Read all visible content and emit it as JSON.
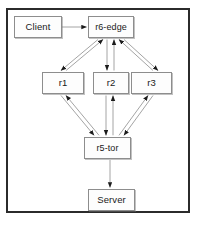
{
  "diagram": {
    "canvas": {
      "width": 200,
      "height": 226
    },
    "background_color": "#ffffff",
    "frame": {
      "name": "diagram-border",
      "x": 6,
      "y": 8,
      "width": 184,
      "height": 205,
      "stroke_color": "#2b2b2b",
      "stroke_width": 2
    },
    "style": {
      "node_fill": "#fdfdfd",
      "node_stroke": "#8d8d8d",
      "edge_color": "#9a9a9a",
      "arrowhead_color": "#1c1c1c",
      "text_color": "#1a1a1a"
    },
    "nodes": [
      {
        "id": "client",
        "label": "Client",
        "x": 14,
        "y": 16,
        "width": 48,
        "height": 22
      },
      {
        "id": "r6edge",
        "label": "r6-edge",
        "x": 88,
        "y": 16,
        "width": 46,
        "height": 22
      },
      {
        "id": "r1",
        "label": "r1",
        "x": 42,
        "y": 72,
        "width": 42,
        "height": 22
      },
      {
        "id": "r2",
        "label": "r2",
        "x": 93,
        "y": 72,
        "width": 36,
        "height": 22
      },
      {
        "id": "r3",
        "label": "r3",
        "x": 131,
        "y": 72,
        "width": 41,
        "height": 22
      },
      {
        "id": "r5tor",
        "label": "r5-tor",
        "x": 84,
        "y": 137,
        "width": 47,
        "height": 22
      },
      {
        "id": "server",
        "label": "Server",
        "x": 88,
        "y": 189,
        "width": 47,
        "height": 22
      }
    ],
    "edges": [
      {
        "from": "client",
        "to": "r6edge",
        "direction": "one-way",
        "label": ""
      },
      {
        "from": "r6edge",
        "to": "r1",
        "direction": "bidirectional",
        "label": ""
      },
      {
        "from": "r6edge",
        "to": "r2",
        "direction": "bidirectional",
        "label": ""
      },
      {
        "from": "r6edge",
        "to": "r3",
        "direction": "bidirectional",
        "label": ""
      },
      {
        "from": "r1",
        "to": "r5tor",
        "direction": "bidirectional",
        "label": ""
      },
      {
        "from": "r2",
        "to": "r5tor",
        "direction": "bidirectional",
        "label": ""
      },
      {
        "from": "r3",
        "to": "r5tor",
        "direction": "bidirectional",
        "label": ""
      },
      {
        "from": "r5tor",
        "to": "server",
        "direction": "one-way",
        "label": ""
      }
    ]
  }
}
